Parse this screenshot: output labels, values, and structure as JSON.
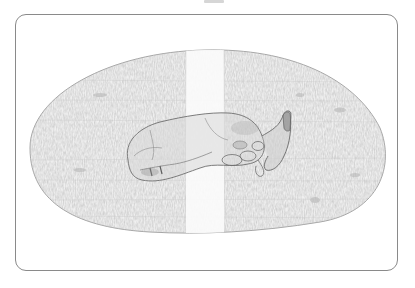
{
  "figure": {
    "colors": {
      "frame_border": "#8a8a8a",
      "specimen_fill": "#e9e9e9",
      "specimen_outline": "#9a9a9a",
      "band": "#fbfbfb",
      "organism_outline": "#6e6e6e",
      "organism_shading": "#9c9c9c"
    }
  }
}
